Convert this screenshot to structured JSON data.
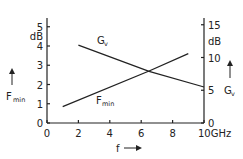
{
  "chart_data": {
    "type": "line",
    "title": "",
    "xlabel": "f",
    "x_unit": "GHz",
    "xlim": [
      0,
      10
    ],
    "x_ticks": [
      0,
      2,
      4,
      6,
      8,
      10
    ],
    "y_left": {
      "label": "F",
      "label_sub": "min",
      "unit": "dB",
      "lim": [
        0,
        5.5
      ],
      "ticks": [
        0,
        1,
        2,
        3,
        4,
        5
      ]
    },
    "y_right": {
      "label": "G",
      "label_sub": "v",
      "unit": "dB",
      "lim": [
        0,
        17
      ],
      "ticks": [
        0,
        5,
        10,
        15
      ]
    },
    "grid": false,
    "legend": "inline labels",
    "series": [
      {
        "name": "Fmin",
        "label": "F",
        "label_sub": "min",
        "axis": "left",
        "x": [
          1,
          6.5,
          9
        ],
        "y": [
          0.85,
          2.7,
          3.6
        ]
      },
      {
        "name": "Gv",
        "label": "G",
        "label_sub": "v",
        "axis": "right",
        "x": [
          2,
          6.5,
          10
        ],
        "y": [
          11.9,
          7.9,
          5.5
        ]
      }
    ]
  }
}
